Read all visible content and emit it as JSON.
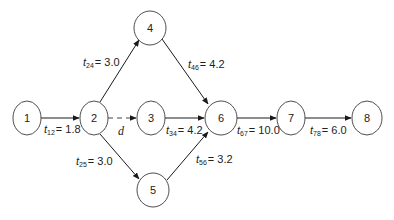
{
  "diagram": {
    "type": "activity-network",
    "nodes": [
      {
        "id": "1",
        "label": "1",
        "cx": 27,
        "cy": 118,
        "rx": 14,
        "ry": 17
      },
      {
        "id": "2",
        "label": "2",
        "cx": 94,
        "cy": 118,
        "rx": 14,
        "ry": 17
      },
      {
        "id": "3",
        "label": "3",
        "cx": 151,
        "cy": 118,
        "rx": 14,
        "ry": 17
      },
      {
        "id": "4",
        "label": "4",
        "cx": 150,
        "cy": 28,
        "rx": 16,
        "ry": 17
      },
      {
        "id": "5",
        "label": "5",
        "cx": 153,
        "cy": 190,
        "rx": 16,
        "ry": 17
      },
      {
        "id": "6",
        "label": "6",
        "cx": 221,
        "cy": 118,
        "rx": 16,
        "ry": 17
      },
      {
        "id": "7",
        "label": "7",
        "cx": 291,
        "cy": 118,
        "rx": 14,
        "ry": 17
      },
      {
        "id": "8",
        "label": "8",
        "cx": 367,
        "cy": 118,
        "rx": 15,
        "ry": 17
      }
    ],
    "edges": [
      {
        "from": "1",
        "to": "2",
        "label": "t",
        "sub": "12",
        "value": "= 1.8",
        "dashed": false
      },
      {
        "from": "2",
        "to": "4",
        "label": "t",
        "sub": "24",
        "value": "= 3.0",
        "dashed": false
      },
      {
        "from": "2",
        "to": "3",
        "label": "d",
        "sub": "",
        "value": "",
        "dashed": true
      },
      {
        "from": "2",
        "to": "5",
        "label": "t",
        "sub": "25",
        "value": "= 3.0",
        "dashed": false
      },
      {
        "from": "4",
        "to": "6",
        "label": "t",
        "sub": "46",
        "value": "= 4.2",
        "dashed": false
      },
      {
        "from": "3",
        "to": "6",
        "label": "t",
        "sub": "34",
        "value": "= 4.2",
        "dashed": false
      },
      {
        "from": "5",
        "to": "6",
        "label": "t",
        "sub": "56",
        "value": "= 3.2",
        "dashed": false
      },
      {
        "from": "6",
        "to": "7",
        "label": "t",
        "sub": "67",
        "value": "= 10.0",
        "dashed": false
      },
      {
        "from": "7",
        "to": "8",
        "label": "t",
        "sub": "78",
        "value": "= 6.0",
        "dashed": false
      }
    ],
    "labels": {
      "n1": "1",
      "n2": "2",
      "n3": "3",
      "n4": "4",
      "n5": "5",
      "n6": "6",
      "n7": "7",
      "n8": "8",
      "t": "t",
      "sub12": "12",
      "val12": "= 1.8",
      "sub24": "24",
      "val24": "= 3.0",
      "sub25": "25",
      "val25": "= 3.0",
      "sub46": "46",
      "val46": "= 4.2",
      "sub34": "34",
      "val34": "= 4.2",
      "sub56": "56",
      "val56": "= 3.2",
      "sub67": "67",
      "val67": "= 10.0",
      "sub78": "78",
      "val78": "= 6.0",
      "dummy": "d"
    }
  }
}
